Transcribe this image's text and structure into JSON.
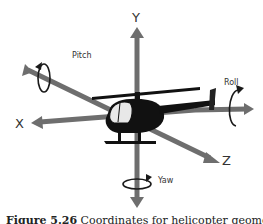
{
  "diagram": {
    "axes": {
      "y_label": "Y",
      "x_label": "X",
      "z_label": "Z"
    },
    "rotations": {
      "pitch_label": "Pitch",
      "roll_label": "Roll",
      "yaw_label": "Yaw"
    },
    "colors": {
      "axis": "#6e6e6e",
      "helicopter": "#111111",
      "arrow_curve": "#1a1a1a"
    }
  },
  "caption": {
    "figure_number": "Figure 5.26",
    "text": "Coordinates for helicopter geometry"
  }
}
